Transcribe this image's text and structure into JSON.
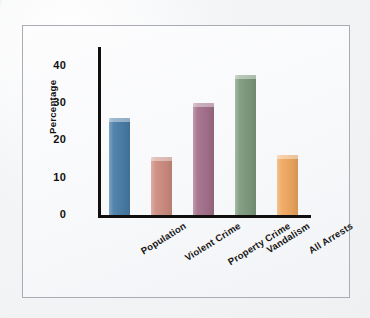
{
  "figure": {
    "frame_present": true,
    "background_color": "#f7f8fa",
    "page_color": "#f2f3f5"
  },
  "axis": {
    "y_title": "Percentage",
    "y_ticks": [
      "40",
      "30",
      "20",
      "10",
      "0"
    ],
    "axis_color": "#100f0d"
  },
  "chart_data": {
    "type": "bar",
    "title": "",
    "xlabel": "",
    "ylabel": "Percentage",
    "ylim": [
      0,
      45
    ],
    "yticks": [
      0,
      10,
      20,
      30,
      40
    ],
    "grid": false,
    "legend": "none",
    "categories": [
      "Population",
      "Violent Crime",
      "Property Crime",
      "Vandalism",
      "All Arrests"
    ],
    "values": [
      26,
      15.5,
      30,
      37.5,
      16
    ],
    "bar_colors": [
      "#4a7ea8",
      "#ce8d81",
      "#a4708b",
      "#7e9b7e",
      "#f0a860"
    ],
    "series": [
      {
        "name": "Percentage",
        "values": [
          26,
          15.5,
          30,
          37.5,
          16
        ]
      }
    ],
    "points": [
      {
        "category": "Population",
        "value": 26,
        "color": "#4a7ea8"
      },
      {
        "category": "Violent Crime",
        "value": 15.5,
        "color": "#ce8d81"
      },
      {
        "category": "Property Crime",
        "value": 30,
        "color": "#a4708b"
      },
      {
        "category": "Vandalism",
        "value": 37.5,
        "color": "#7e9b7e"
      },
      {
        "category": "All Arrests",
        "value": 16,
        "color": "#f0a860"
      }
    ]
  }
}
